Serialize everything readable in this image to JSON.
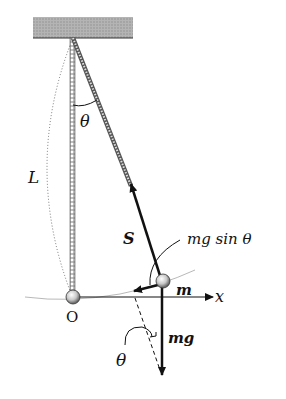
{
  "diagram": {
    "type": "pendulum-force-diagram",
    "labels": {
      "length": "L",
      "angle_top": "θ",
      "tension": "S",
      "tangential_force": "mg sin θ",
      "mass": "m",
      "axis": "x",
      "origin": "O",
      "weight": "mg",
      "angle_bottom": "θ"
    },
    "colors": {
      "ceiling": "#a8a8a8",
      "ink": "#111111",
      "arc": "#b0b0b0",
      "bob": "#bdbdbd"
    }
  }
}
